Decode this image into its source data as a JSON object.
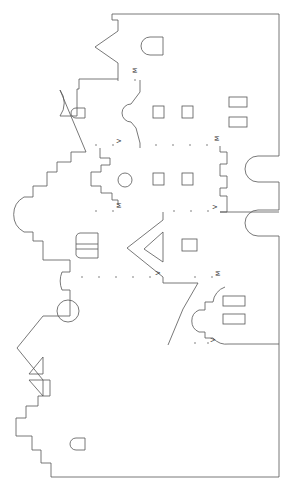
{
  "template": {
    "type": "papercraft pop-up facade cut template",
    "fold_labels": {
      "mountain": "M",
      "valley": "V"
    },
    "labels": [
      {
        "text": "M",
        "x": 137,
        "y": 73
      },
      {
        "text": "V",
        "x": 119,
        "y": 140
      },
      {
        "text": "M",
        "x": 217,
        "y": 140
      },
      {
        "text": "M",
        "x": 119,
        "y": 204
      },
      {
        "text": "V",
        "x": 215,
        "y": 206
      },
      {
        "text": "V",
        "x": 158,
        "y": 271
      },
      {
        "text": "M",
        "x": 218,
        "y": 273
      },
      {
        "text": "V",
        "x": 213,
        "y": 339
      }
    ],
    "stroke_color": "#555555",
    "background_color": "#ffffff"
  }
}
